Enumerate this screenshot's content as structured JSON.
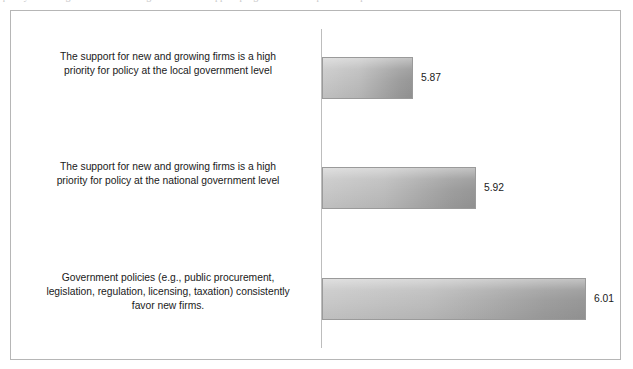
{
  "figure": {
    "top_text_remnant": "quality of the legal framework and governmental support programs for entrepreneurship",
    "frame_color": "#b6b6b6",
    "axis_color": "#bdbdbd",
    "bar_fill_light": "#c9c9c9",
    "bar_fill_dark": "#979797",
    "bar_border": "#9a9a9a",
    "text_color": "#1a1a1a"
  },
  "chart_data": {
    "type": "bar",
    "orientation": "horizontal",
    "title": "",
    "subtitle": "",
    "xlabel": "",
    "ylabel": "",
    "grid": false,
    "legend": false,
    "legend_position": "none",
    "xlim": [
      0,
      7
    ],
    "axis_ticks_visible": false,
    "value_label_format": "2dp",
    "categories": [
      "The support for new and growing firms is a high priority for policy at the local government level",
      "The support for new and growing firms is a high priority for policy at the national government level",
      "Government policies (e.g., public procurement, legislation, regulation, licensing, taxation) consistently favor new firms."
    ],
    "category_lines": [
      [
        "The support for new and growing firms is a high",
        "priority for policy at the local government level"
      ],
      [
        "The support for new and growing firms is a high",
        "priority for policy at the national government level"
      ],
      [
        "Government policies (e.g., public procurement,",
        "legislation, regulation, licensing, taxation) consistently",
        "favor new firms."
      ]
    ],
    "values": [
      5.87,
      5.92,
      6.01
    ],
    "value_labels": [
      "5.87",
      "5.92",
      "6.01"
    ],
    "bar_pixel_widths": [
      91,
      154,
      264
    ],
    "bar_value_label_offsets": [
      99,
      162,
      272
    ]
  }
}
